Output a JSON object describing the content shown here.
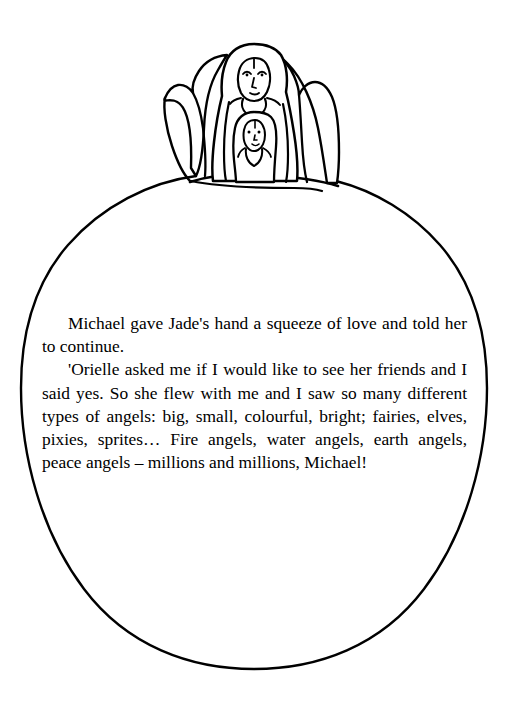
{
  "page": {
    "width": 509,
    "height": 716,
    "background_color": "#ffffff",
    "ink_color": "#000000"
  },
  "illustration": {
    "name": "angel-with-child-on-globe",
    "description": "Line drawing of a winged angel figure holding a smaller child figure, standing on the crest of a large oval globe; the oval frames the body text.",
    "elements": [
      "large-oval-outline",
      "angel-left-wing",
      "angel-right-wing",
      "angel-robe",
      "angel-face",
      "child-face",
      "ground-line"
    ]
  },
  "body": {
    "paragraphs": [
      "Michael gave Jade's hand a squeeze of love and told her to continue.",
      "'Orielle asked me if I would like to see her friends and I said yes. So she flew with me and I saw so many different types of angels: big, small, colourful, bright; fairies, elves, pixies, sprites… Fire angels, water angels, earth angels, peace angels – millions and millions, Michael!"
    ],
    "lines": [
      "Michael gave Jade's hand a squeeze of love and",
      "told her to continue.",
      "'Orielle asked me if I would like to see her",
      "friends and I said yes. So she flew with me and I",
      "saw so many different types of angels: big, small,",
      "colourful, bright; fairies, elves, pixies, sprites…",
      "Fire angels, water angels, earth angels, peace angels",
      "– millions and millions, Michael!"
    ]
  }
}
